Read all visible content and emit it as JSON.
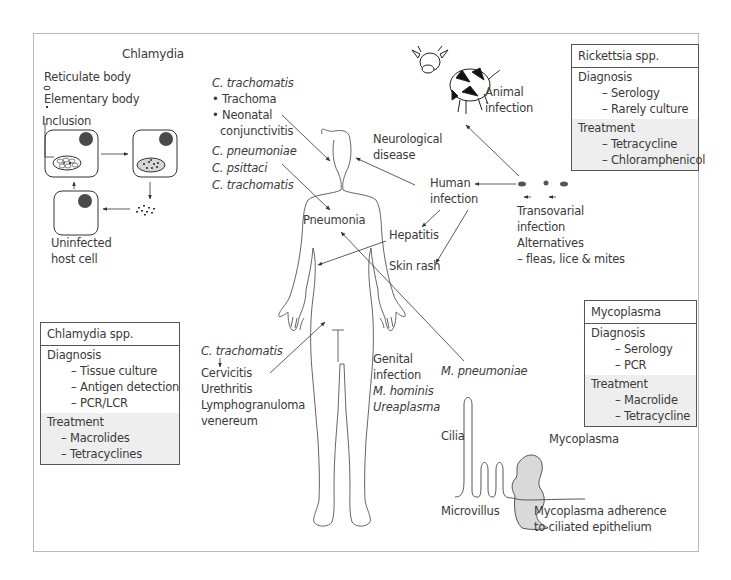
{
  "chlamydia_cycle": {
    "title": "Chlamydia",
    "legend": {
      "reticulate_body": "Reticulate body",
      "elementary_body": "Elementary body",
      "inclusion": "Inclusion"
    },
    "uninfected_label_1": "Uninfected",
    "uninfected_label_2": "host cell"
  },
  "eye_label": {
    "organism": "C. trachomatis",
    "items": [
      "• Trachoma",
      "• Neonatal",
      "  conjunctivitis"
    ]
  },
  "pneumonia_sources": [
    "C. pneumoniae",
    "C. psittaci",
    "C. trachomatis"
  ],
  "body_labels": {
    "pneumonia": "Pneumonia",
    "neurological_1": "Neurological",
    "neurological_2": "disease",
    "human_infection_1": "Human",
    "human_infection_2": "infection",
    "hepatitis": "Hepatitis",
    "skin_rash": "Skin rash",
    "animal_infection_1": "Animal",
    "animal_infection_2": "infection"
  },
  "vector": {
    "lines": [
      "Transovarial",
      "infection",
      "Alternatives",
      "  – fleas, lice & mites"
    ]
  },
  "genital_ct": {
    "organism": "C. trachomatis",
    "items": [
      "Cervicitis",
      "Urethritis",
      "Lymphogranuloma"
    ],
    "italic_item": "venereum"
  },
  "genital_myco": {
    "lines": [
      "Genital",
      "infection"
    ],
    "italic_lines": [
      "M. hominis",
      "Ureaplasma"
    ]
  },
  "m_pneumoniae": "M. pneumoniae",
  "epithelium": {
    "cilia": "Cilia",
    "microvillus": "Microvillus",
    "mycoplasma": "Mycoplasma",
    "caption_1": "Mycoplasma adherence",
    "caption_2": "to ciliated epithelium"
  },
  "boxes": {
    "rickettsia": {
      "title": "Rickettsia spp.",
      "diagnosis_label": "Diagnosis",
      "diagnosis": [
        "– Serology",
        "– Rarely culture"
      ],
      "treatment_label": "Treatment",
      "treatment": [
        "– Tetracycline",
        "– Chloramphenicol"
      ]
    },
    "mycoplasma": {
      "title": "Mycoplasma",
      "diagnosis_label": "Diagnosis",
      "diagnosis": [
        "– Serology",
        "– PCR"
      ],
      "treatment_label": "Treatment",
      "treatment": [
        "– Macrolide",
        "– Tetracycline"
      ]
    },
    "chlamydia": {
      "title": "Chlamydia spp.",
      "diagnosis_label": "Diagnosis",
      "diagnosis": [
        "– Tissue culture",
        "– Antigen detection",
        "– PCR/LCR"
      ],
      "treatment_label": "Treatment",
      "treatment": [
        "– Macrolides",
        "– Tetracyclines"
      ]
    }
  },
  "colors": {
    "line": "#333333",
    "frame": "#b9b9b9",
    "shade": "#eeeeee",
    "mycoplasma_fill": "#d9d9d9",
    "nucleus": "#4a4a4a"
  }
}
